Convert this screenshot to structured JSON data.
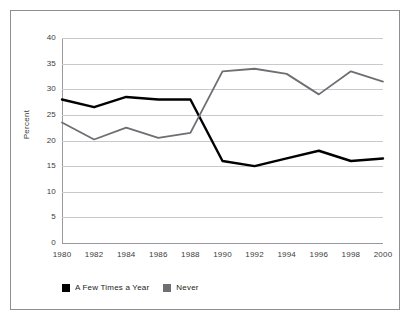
{
  "chart_data": {
    "type": "line",
    "title": "",
    "subtitle": "",
    "xlabel": "",
    "ylabel": "Percent",
    "x": [
      1980,
      1982,
      1984,
      1986,
      1988,
      1990,
      1992,
      1994,
      1996,
      1998,
      2000
    ],
    "xtick_labels": [
      "1980",
      "1982",
      "1984",
      "1986",
      "1988",
      "1990",
      "1992",
      "1994",
      "1996",
      "1998",
      "2000"
    ],
    "ytick_labels": [
      "40",
      "35",
      "30",
      "25",
      "20",
      "15",
      "10",
      "5",
      "0"
    ],
    "yticks": [
      40,
      35,
      30,
      25,
      20,
      15,
      10,
      5,
      0
    ],
    "ylim": [
      0,
      40
    ],
    "xlim": [
      1980,
      2000
    ],
    "grid": "horizontal",
    "legend_position": "bottom-left",
    "series": [
      {
        "name": "A Few Times a Year",
        "color": "#000000",
        "values": [
          28,
          26.5,
          28.5,
          28,
          28,
          16,
          15,
          16.5,
          18,
          16,
          16.5
        ]
      },
      {
        "name": "Never",
        "color": "#6e6e73",
        "values": [
          23.5,
          20.2,
          22.5,
          20.5,
          21.5,
          33.5,
          34,
          33,
          29,
          33.5,
          31.5
        ]
      }
    ],
    "colors": {
      "series_a_few_times_a_year": "#000000",
      "series_never": "#6e6e73",
      "gridline": "#c9c9cc",
      "axis": "#9a9a9e",
      "frame_border": "#8d8d93",
      "background": "#ffffff",
      "tick_text": "#3b3b40"
    }
  },
  "legend": {
    "items": [
      {
        "label": "A Few Times a Year",
        "color": "#000000"
      },
      {
        "label": "Never",
        "color": "#6e6e73"
      }
    ]
  }
}
